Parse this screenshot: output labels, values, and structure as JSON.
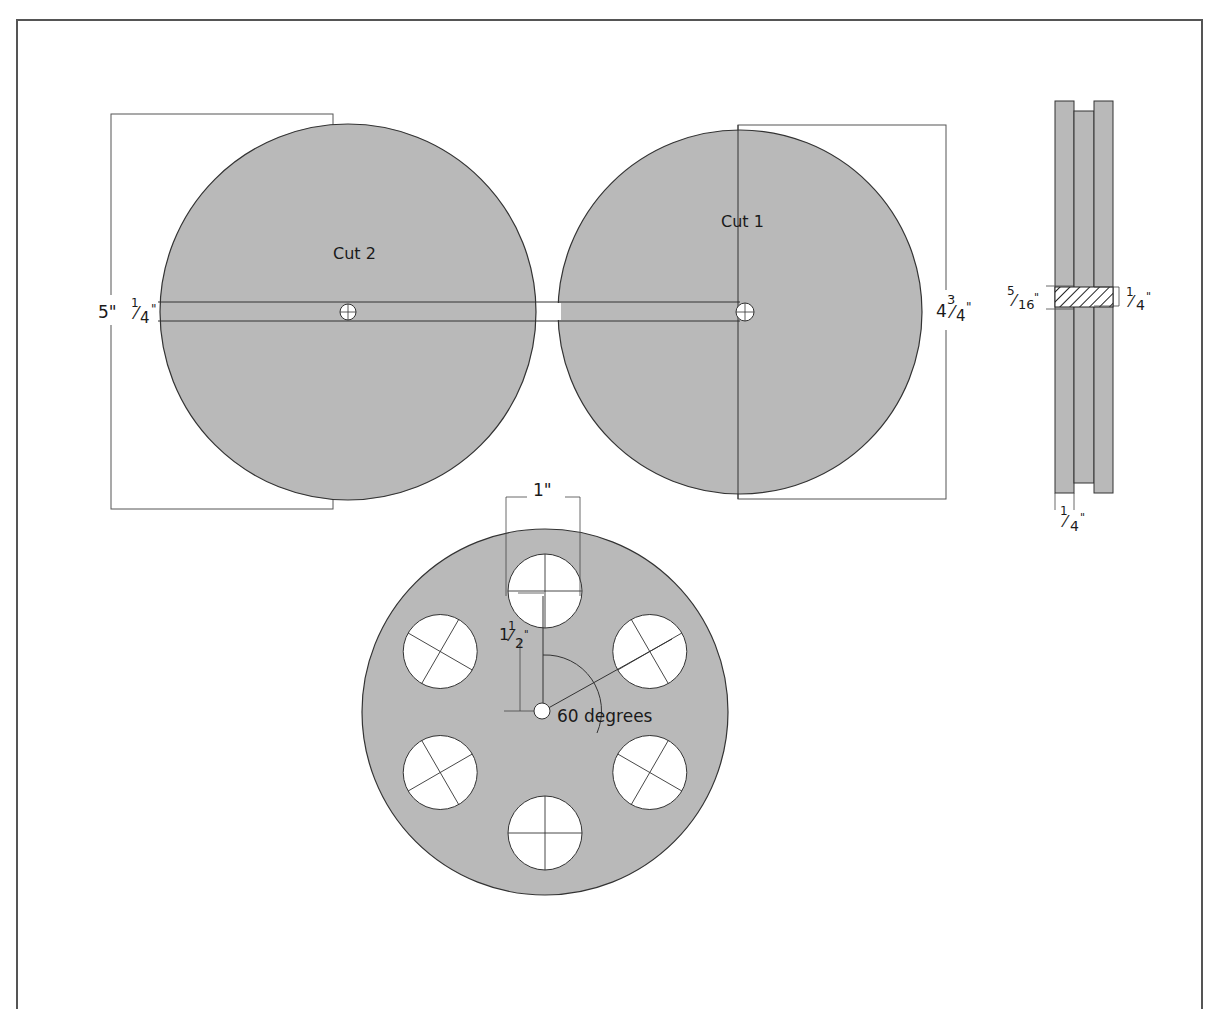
{
  "colors": {
    "disc_fill": "#b9b9b9",
    "outline": "#333333",
    "dimension_line": "#444444",
    "hole_fill": "#ffffff",
    "background": "#ffffff"
  },
  "labels": {
    "cut2": "Cut 2",
    "cut1": "Cut 1",
    "overall_height": "5\"",
    "slot_width_num": "1",
    "slot_width_den": "4",
    "slot_width_inch": "\"",
    "disc_diameter_whole": "4",
    "disc_diameter_num": "3",
    "disc_diameter_den": "4",
    "disc_diameter_inch": "\"",
    "hub_left_num": "5",
    "hub_left_den": "16",
    "hub_left_inch": "\"",
    "hub_right_num": "1",
    "hub_right_den": "4",
    "hub_right_inch": "\"",
    "groove_num": "1",
    "groove_den": "4",
    "groove_inch": "\"",
    "hole_diameter": "1\"",
    "hole_radius_whole": "1",
    "hole_radius_num": "1",
    "hole_radius_den": "2",
    "hole_radius_inch": "\"",
    "angle": "60 degrees"
  },
  "reel": {
    "hole_count": 6,
    "hole_spacing_degrees": 60
  }
}
